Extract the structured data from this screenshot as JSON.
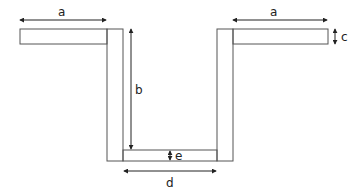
{
  "diagram": {
    "type": "channel-cross-section",
    "colors": {
      "stroke": "#555555",
      "dimension": "#222222",
      "background": "#ffffff"
    },
    "labels": {
      "a_left": "a",
      "a_right": "a",
      "b": "b",
      "c": "c",
      "d": "d",
      "e": "e"
    },
    "dimensions": [
      {
        "name": "a",
        "description": "left flange length"
      },
      {
        "name": "a",
        "description": "right flange length"
      },
      {
        "name": "b",
        "description": "inner wall height"
      },
      {
        "name": "c",
        "description": "flange thickness"
      },
      {
        "name": "d",
        "description": "inner bottom width"
      },
      {
        "name": "e",
        "description": "bottom thickness"
      }
    ]
  }
}
